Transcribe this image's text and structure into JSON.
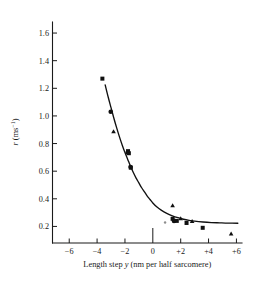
{
  "chart_data": {
    "type": "scatter",
    "title": "",
    "xlabel": "Length step y (nm per half sarcomere)",
    "ylabel": "r (ms⁻¹)",
    "xlabel_parts": {
      "prefix": "Length step ",
      "italic_var": "y",
      "suffix": " (nm per half sarcomere)"
    },
    "ylabel_parts": {
      "italic_var": "r",
      "units": " (ms",
      "exponent": "−1",
      "units_close": ")"
    },
    "xlim": [
      -7.2,
      6.4
    ],
    "ylim": [
      0.08,
      1.68
    ],
    "grid": false,
    "legend": "none",
    "xticks": [
      -6,
      -4,
      -2,
      0,
      2,
      4,
      6
    ],
    "xtick_labels": [
      "−6",
      "−4",
      "−2",
      "0",
      "+2",
      "+4",
      "+6"
    ],
    "yticks": [
      0.2,
      0.4,
      0.6,
      0.8,
      1.0,
      1.2,
      1.4,
      1.6
    ],
    "ytick_labels": [
      "0.2",
      "0.4",
      "0.6",
      "0.8",
      "1.0",
      "1.2",
      "1.4",
      "1.6"
    ],
    "series": [
      {
        "name": "square-markers",
        "marker": "square",
        "points": [
          {
            "x": -3.62,
            "y": 1.27
          },
          {
            "x": -1.78,
            "y": 0.745
          },
          {
            "x": -1.72,
            "y": 0.73
          },
          {
            "x": -1.58,
            "y": 0.625
          },
          {
            "x": 1.42,
            "y": 0.255
          },
          {
            "x": 1.72,
            "y": 0.24
          },
          {
            "x": 2.42,
            "y": 0.225
          },
          {
            "x": 3.58,
            "y": 0.19
          }
        ]
      },
      {
        "name": "circle-markers",
        "marker": "circle",
        "points": [
          {
            "x": -3.02,
            "y": 1.03
          },
          {
            "x": -1.8,
            "y": 0.735
          },
          {
            "x": -1.6,
            "y": 0.63
          },
          {
            "x": 1.52,
            "y": 0.24
          }
        ]
      },
      {
        "name": "triangle-markers",
        "marker": "triangle",
        "points": [
          {
            "x": -2.82,
            "y": 0.885
          },
          {
            "x": 1.42,
            "y": 0.35
          },
          {
            "x": 2.0,
            "y": 0.255
          },
          {
            "x": 2.82,
            "y": 0.235
          },
          {
            "x": 5.62,
            "y": 0.145
          }
        ]
      },
      {
        "name": "faint-marker",
        "marker": "small-dot",
        "points": [
          {
            "x": 0.88,
            "y": 0.228
          }
        ]
      }
    ],
    "fit_curve": {
      "name": "exponential decay fit",
      "points": [
        {
          "x": -3.42,
          "y": 1.225
        },
        {
          "x": -3.2,
          "y": 1.135
        },
        {
          "x": -3.0,
          "y": 1.06
        },
        {
          "x": -2.8,
          "y": 0.985
        },
        {
          "x": -2.6,
          "y": 0.915
        },
        {
          "x": -2.4,
          "y": 0.85
        },
        {
          "x": -2.2,
          "y": 0.79
        },
        {
          "x": -2.0,
          "y": 0.735
        },
        {
          "x": -1.8,
          "y": 0.685
        },
        {
          "x": -1.6,
          "y": 0.635
        },
        {
          "x": -1.4,
          "y": 0.59
        },
        {
          "x": -1.2,
          "y": 0.55
        },
        {
          "x": -1.0,
          "y": 0.515
        },
        {
          "x": -0.8,
          "y": 0.48
        },
        {
          "x": -0.6,
          "y": 0.45
        },
        {
          "x": -0.4,
          "y": 0.42
        },
        {
          "x": -0.2,
          "y": 0.395
        },
        {
          "x": 0.0,
          "y": 0.37
        },
        {
          "x": 0.3,
          "y": 0.34
        },
        {
          "x": 0.6,
          "y": 0.318
        },
        {
          "x": 1.0,
          "y": 0.295
        },
        {
          "x": 1.4,
          "y": 0.277
        },
        {
          "x": 1.8,
          "y": 0.263
        },
        {
          "x": 2.2,
          "y": 0.252
        },
        {
          "x": 2.6,
          "y": 0.244
        },
        {
          "x": 3.0,
          "y": 0.238
        },
        {
          "x": 3.6,
          "y": 0.232
        },
        {
          "x": 4.2,
          "y": 0.228
        },
        {
          "x": 4.8,
          "y": 0.226
        },
        {
          "x": 5.4,
          "y": 0.224
        },
        {
          "x": 6.1,
          "y": 0.223
        }
      ]
    }
  }
}
